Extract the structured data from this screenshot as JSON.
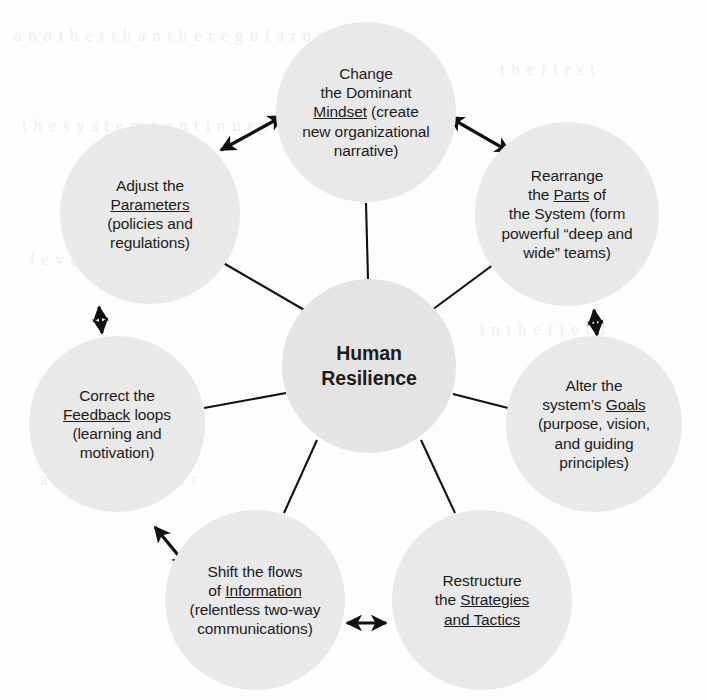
{
  "diagram": {
    "type": "hub-and-spoke-cycle",
    "center": {
      "id": "human-resilience",
      "label": "Human Resilience",
      "line1": "Human",
      "line2": "Resilience",
      "cx": 369,
      "cy": 366,
      "r": 87
    },
    "fill_color": "#e9e9e9",
    "line_color": "#111111",
    "text_color": "#1c1c1c",
    "nodes": [
      {
        "id": "mindset",
        "position": "top",
        "cx": 366,
        "cy": 112,
        "r": 90,
        "label": "Change the Dominant Mindset (create new organizational narrative)",
        "keyword": "Mindset",
        "lines": [
          [
            {
              "t": "Change",
              "u": false
            }
          ],
          [
            {
              "t": "the Dominant",
              "u": false
            }
          ],
          [
            {
              "t": "Mindset",
              "u": true
            },
            {
              "t": " (create",
              "u": false
            }
          ],
          [
            {
              "t": "new organizational",
              "u": false
            }
          ],
          [
            {
              "t": "narrative)",
              "u": false
            }
          ]
        ]
      },
      {
        "id": "parts",
        "position": "top-right",
        "cx": 567,
        "cy": 214,
        "r": 92,
        "label": "Rearrange the Parts of the System (form powerful “deep and wide” teams)",
        "keyword": "Parts",
        "lines": [
          [
            {
              "t": "Rearrange",
              "u": false
            }
          ],
          [
            {
              "t": "the ",
              "u": false
            },
            {
              "t": "Parts",
              "u": true
            },
            {
              "t": " of",
              "u": false
            }
          ],
          [
            {
              "t": "the System (form",
              "u": false
            }
          ],
          [
            {
              "t": "powerful “deep and",
              "u": false
            }
          ],
          [
            {
              "t": "wide” teams)",
              "u": false
            }
          ]
        ]
      },
      {
        "id": "goals",
        "position": "right",
        "cx": 594,
        "cy": 424,
        "r": 88,
        "label": "Alter the system’s Goals (purpose, vision, and guiding principles)",
        "keyword": "Goals",
        "lines": [
          [
            {
              "t": "Alter the",
              "u": false
            }
          ],
          [
            {
              "t": "system’s ",
              "u": false
            },
            {
              "t": "Goals",
              "u": true
            }
          ],
          [
            {
              "t": "(purpose, vision,",
              "u": false
            }
          ],
          [
            {
              "t": "and guiding",
              "u": false
            }
          ],
          [
            {
              "t": "principles)",
              "u": false
            }
          ]
        ]
      },
      {
        "id": "strategies",
        "position": "bottom-right",
        "cx": 482,
        "cy": 600,
        "r": 90,
        "label": "Restructure the Strategies and Tactics",
        "keyword": "Strategies and Tactics",
        "lines": [
          [
            {
              "t": "Restructure",
              "u": false
            }
          ],
          [
            {
              "t": "the ",
              "u": false
            },
            {
              "t": "Strategies ",
              "u": true
            }
          ],
          [
            {
              "t": "and Tactics",
              "u": true
            }
          ]
        ]
      },
      {
        "id": "information",
        "position": "bottom-left",
        "cx": 255,
        "cy": 600,
        "r": 90,
        "label": "Shift the flows of Information (relentless two-way communications)",
        "keyword": "Information",
        "lines": [
          [
            {
              "t": "Shift the flows",
              "u": false
            }
          ],
          [
            {
              "t": "of ",
              "u": false
            },
            {
              "t": "Information",
              "u": true
            }
          ],
          [
            {
              "t": "(relentless two-way",
              "u": false
            }
          ],
          [
            {
              "t": "communications)",
              "u": false
            }
          ]
        ]
      },
      {
        "id": "feedback",
        "position": "left",
        "cx": 117,
        "cy": 424,
        "r": 88,
        "label": "Correct the Feedback loops (learning and motivation)",
        "keyword": "Feedback",
        "lines": [
          [
            {
              "t": "Correct the",
              "u": false
            }
          ],
          [
            {
              "t": "Feedback",
              "u": true
            },
            {
              "t": " loops",
              "u": false
            }
          ],
          [
            {
              "t": "(learning and",
              "u": false
            }
          ],
          [
            {
              "t": "motivation)",
              "u": false
            }
          ]
        ]
      },
      {
        "id": "parameters",
        "position": "top-left",
        "cx": 150,
        "cy": 214,
        "r": 90,
        "label": "Adjust the Parameters (policies and regulations)",
        "keyword": "Parameters",
        "lines": [
          [
            {
              "t": "Adjust the",
              "u": false
            }
          ],
          [
            {
              "t": "Parameters",
              "u": true
            }
          ],
          [
            {
              "t": "(policies and",
              "u": false
            }
          ],
          [
            {
              "t": "regulations)",
              "u": false
            }
          ]
        ]
      }
    ],
    "spokes": [
      {
        "from": "human-resilience",
        "to": "mindset",
        "arrowheads": "none"
      },
      {
        "from": "human-resilience",
        "to": "parts",
        "arrowheads": "none"
      },
      {
        "from": "human-resilience",
        "to": "goals",
        "arrowheads": "none"
      },
      {
        "from": "human-resilience",
        "to": "strategies",
        "arrowheads": "none"
      },
      {
        "from": "human-resilience",
        "to": "information",
        "arrowheads": "none"
      },
      {
        "from": "human-resilience",
        "to": "feedback",
        "arrowheads": "none"
      },
      {
        "from": "human-resilience",
        "to": "parameters",
        "arrowheads": "none"
      }
    ],
    "ring_arrows": [
      {
        "from": "parameters",
        "to": "mindset",
        "arrowheads": "both"
      },
      {
        "from": "mindset",
        "to": "parts",
        "arrowheads": "both"
      },
      {
        "from": "parts",
        "to": "goals",
        "arrowheads": "both"
      },
      {
        "from": "goals",
        "to": "strategies",
        "arrowheads": "both"
      },
      {
        "from": "strategies",
        "to": "information",
        "arrowheads": "both"
      },
      {
        "from": "information",
        "to": "feedback",
        "arrowheads": "both"
      },
      {
        "from": "feedback",
        "to": "parameters",
        "arrowheads": "both"
      }
    ]
  }
}
